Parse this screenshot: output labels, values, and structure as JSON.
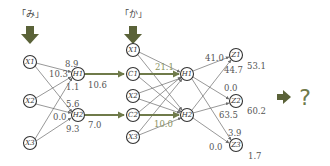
{
  "colors": {
    "context_arrow": "#6f7a4a",
    "down_arrow": "#5a6238",
    "question": "#6f7a4a",
    "edge": "#6b6b6b"
  },
  "step1": {
    "input_char": "「み」",
    "inputs": [
      "X1",
      "X2",
      "X3"
    ],
    "hidden": [
      "H1",
      "H2"
    ],
    "weights": {
      "to_h1_top": "8.9",
      "to_h1_left": "10.3",
      "to_h1_bottom": "1.1",
      "to_h2_top": "5.6",
      "to_h2_left": "0.0",
      "to_h2_bottom": "9.3"
    },
    "outputs": {
      "h1": "10.6",
      "h2": "7.0"
    }
  },
  "step2": {
    "input_char": "「か」",
    "inputs": [
      "X1",
      "C1",
      "X2",
      "C2",
      "X3"
    ],
    "hidden": [
      "H1",
      "H2"
    ],
    "weights": {
      "c1_to_h1": "21.1",
      "c2_to_h2": "10.0"
    },
    "outputs": [
      "Z1",
      "Z2",
      "Z3"
    ],
    "output_weights": {
      "z1_top": "41.0",
      "z1_bottom": "44.7",
      "z2_top": "0.0",
      "z2_bottom": "63.5",
      "z3_top": "3.9",
      "z3_left": "0.0"
    },
    "output_values": {
      "z1": "53.1",
      "z2": "60.2",
      "z3": "1.7"
    }
  },
  "result": {
    "symbol": "?"
  }
}
